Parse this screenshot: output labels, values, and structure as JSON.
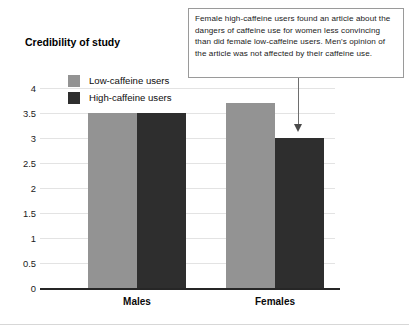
{
  "figure": {
    "background_color": "#ffffff",
    "width": 409,
    "height": 335
  },
  "callout": {
    "text": "Female high-caffeine users found an article about the dangers of caffeine use for women less convincing than did female low-caffeine users. Men's opinion of the article was not affected by their caffeine use.",
    "border_color": "#9a9a9a",
    "pointer_color": "#4a4a4a",
    "points_to": "Females high-caffeine bar"
  },
  "chart_data": {
    "type": "bar",
    "title": "",
    "ylabel": "Credibility of study",
    "xlabel": "",
    "categories": [
      "Males",
      "Females"
    ],
    "series": [
      {
        "name": "Low-caffeine users",
        "color": "#939393",
        "values": [
          3.5,
          3.7
        ]
      },
      {
        "name": "High-caffeine users",
        "color": "#2e2e2e",
        "values": [
          3.5,
          3.0
        ]
      }
    ],
    "ylim": [
      0,
      4
    ],
    "ytick_labels": [
      "0",
      "0.5",
      "1",
      "1.5",
      "2",
      "2.5",
      "3",
      "3.5",
      "4"
    ],
    "ytick_values": [
      0,
      0.5,
      1,
      1.5,
      2,
      2.5,
      3,
      3.5,
      4
    ],
    "grid": true,
    "grid_color": "#e3e3e3",
    "legend_position": "top-left inside",
    "axis_color": "#262626"
  }
}
